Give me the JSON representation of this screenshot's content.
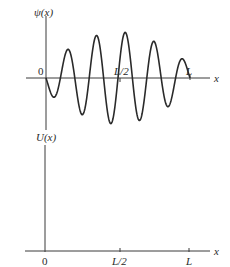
{
  "figure": {
    "top_panel": {
      "y_label": "ψ(x)",
      "x_label": "x",
      "ticks": {
        "origin": "0",
        "half": "L/2",
        "end": "L"
      },
      "curve": "wavefunction"
    },
    "bottom_panel": {
      "y_label": "U(x)",
      "x_label": "x",
      "ticks": {
        "origin": "0",
        "half": "L/2",
        "end": "L"
      }
    }
  },
  "colors": {
    "line": "#2a2a2a",
    "background": "#ffffff"
  }
}
